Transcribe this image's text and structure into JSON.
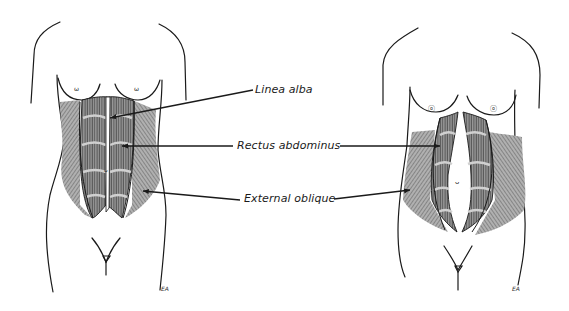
{
  "figure": {
    "panels": [
      {
        "id": "left",
        "state": "normal",
        "signature": "EA"
      },
      {
        "id": "right",
        "state": "diastasis",
        "signature": "EA"
      }
    ],
    "labels": [
      {
        "id": "linea_alba",
        "text": "Linea alba"
      },
      {
        "id": "rectus_abdominus",
        "text": "Rectus abdominus"
      },
      {
        "id": "external_oblique",
        "text": "External oblique"
      }
    ],
    "colors": {
      "outline": "#1a1a1a",
      "muscle_fill": "#7a7a7a",
      "muscle_light": "#b8b8b8",
      "background": "#ffffff"
    }
  }
}
